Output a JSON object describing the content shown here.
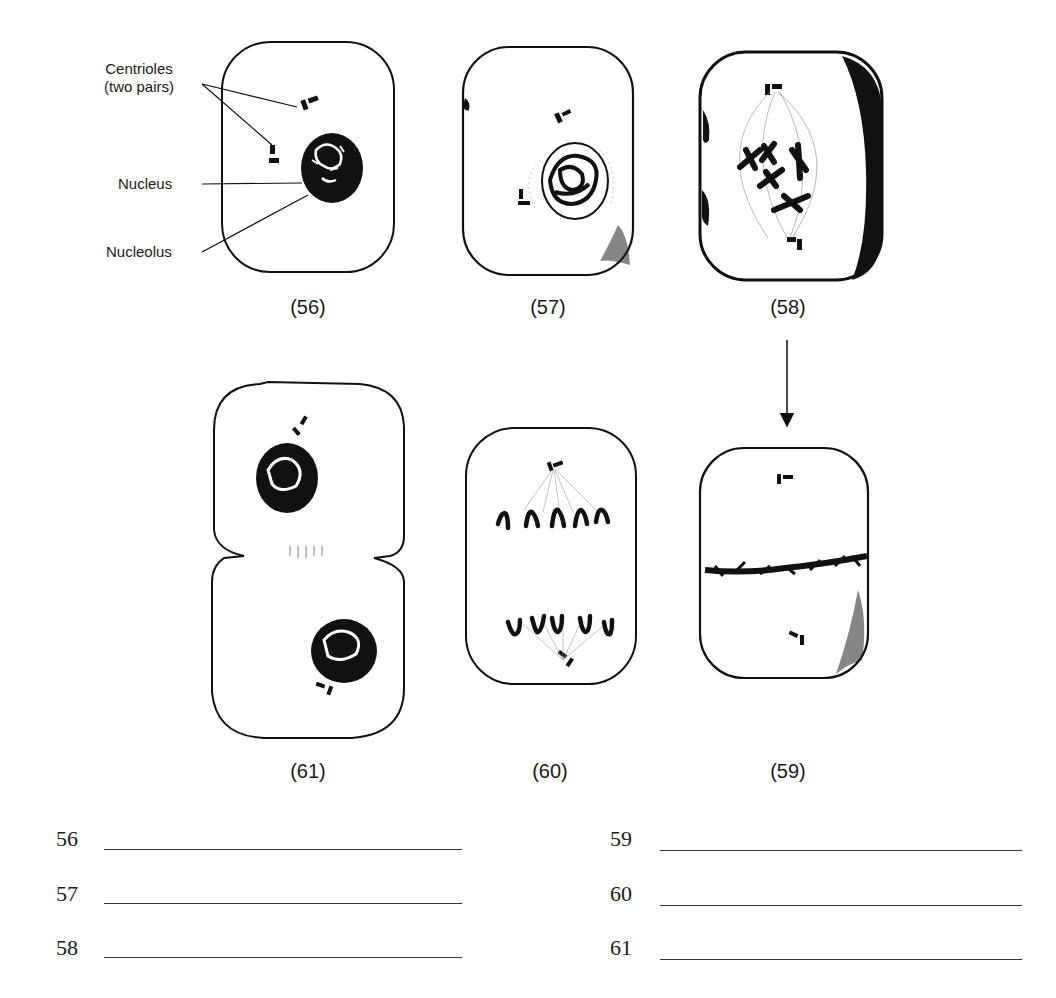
{
  "labels": {
    "centrioles_line1": "Centrioles",
    "centrioles_line2": "(two pairs)",
    "nucleus": "Nucleus",
    "nucleolus": "Nucleolus"
  },
  "figures": [
    {
      "id": "56",
      "caption": "(56)"
    },
    {
      "id": "57",
      "caption": "(57)"
    },
    {
      "id": "58",
      "caption": "(58)"
    },
    {
      "id": "59",
      "caption": "(59)"
    },
    {
      "id": "60",
      "caption": "(60)"
    },
    {
      "id": "61",
      "caption": "(61)"
    }
  ],
  "answers": [
    {
      "number": "56",
      "value": ""
    },
    {
      "number": "57",
      "value": ""
    },
    {
      "number": "58",
      "value": ""
    },
    {
      "number": "59",
      "value": ""
    },
    {
      "number": "60",
      "value": ""
    },
    {
      "number": "61",
      "value": ""
    }
  ],
  "colors": {
    "ink": "#111111",
    "background": "#ffffff"
  }
}
